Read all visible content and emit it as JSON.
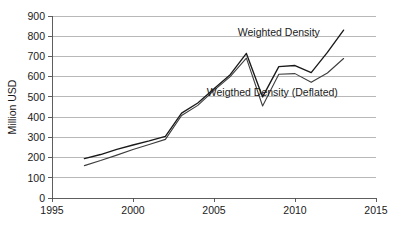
{
  "chart_data": {
    "type": "line",
    "title": "",
    "xlabel": "",
    "ylabel": "Million USD",
    "xlim": [
      1995,
      2015
    ],
    "ylim": [
      0,
      900
    ],
    "ytick_labels": [
      "0",
      "100",
      "200",
      "300",
      "400",
      "500",
      "600",
      "700",
      "800",
      "900"
    ],
    "ytick_values": [
      0,
      100,
      200,
      300,
      400,
      500,
      600,
      700,
      800,
      900
    ],
    "xtick_labels": [
      "1995",
      "2000",
      "2005",
      "2010",
      "2015"
    ],
    "xtick_values": [
      1995,
      2000,
      2005,
      2010,
      2015
    ],
    "grid": true,
    "legend_position": "inline-annotation",
    "x": [
      1997,
      1998,
      1999,
      2000,
      2001,
      2002,
      2003,
      2004,
      2005,
      2006,
      2007,
      2008,
      2009,
      2010,
      2011,
      2012,
      2013
    ],
    "series": [
      {
        "name": "Weighted Density",
        "values": [
          195,
          215,
          240,
          262,
          282,
          305,
          420,
          470,
          540,
          610,
          715,
          500,
          650,
          655,
          620,
          720,
          830
        ]
      },
      {
        "name": "Weigthed Density (Deflated)",
        "values": [
          160,
          185,
          212,
          240,
          265,
          290,
          408,
          458,
          532,
          600,
          692,
          455,
          612,
          615,
          572,
          618,
          690
        ]
      }
    ],
    "annotations": [
      {
        "text": "Weighted Density",
        "x": 2009.0,
        "y": 800
      },
      {
        "text": "Weigthed Density (Deflated)",
        "x": 2008.6,
        "y": 505
      }
    ]
  }
}
